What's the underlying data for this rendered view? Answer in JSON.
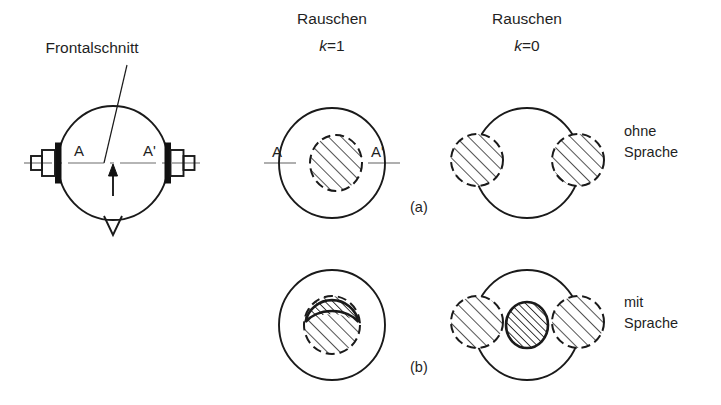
{
  "figure": {
    "title_left": "Frontalschnitt",
    "columns": [
      {
        "name": "Rauschen",
        "condition_prefix": "k",
        "condition_value": "=1"
      },
      {
        "name": "Rauschen",
        "condition_prefix": "k",
        "condition_value": "=0"
      }
    ],
    "rows": [
      {
        "tag": "(a)",
        "side_label_line1": "ohne",
        "side_label_line2": "Sprache"
      },
      {
        "tag": "(b)",
        "side_label_line1": "mit",
        "side_label_line2": "Sprache"
      }
    ],
    "head": {
      "ear_left_label": "A",
      "ear_right_label": "A'"
    },
    "panel_a_k1": {
      "ear_left_label": "A",
      "ear_right_label": "A'"
    },
    "colors": {
      "ink": "#1a1a1a",
      "axis": "#6d6d6d",
      "paper": "#ffffff"
    }
  }
}
